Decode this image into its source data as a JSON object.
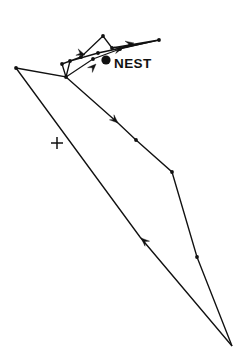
{
  "figure": {
    "background_color": "#ffffff",
    "ink_color": "#111111",
    "width": 242,
    "height": 349
  },
  "labels": {
    "nest_label": "NEST",
    "nest_label_x": 114,
    "nest_label_y": 68,
    "cross_label": "+",
    "cross_x": 57,
    "cross_y": 143
  },
  "chart_data": {
    "type": "line",
    "xlabel": "",
    "ylabel": "",
    "xlim": [
      0,
      242
    ],
    "ylim": [
      0,
      349
    ],
    "grid": false,
    "legend": "none",
    "annotations": [
      {
        "text": "NEST",
        "x": 114,
        "y": 68,
        "kind": "text-label"
      },
      {
        "text": "+",
        "x": 57,
        "y": 143,
        "kind": "reference-cross"
      }
    ],
    "series": [
      {
        "name": "outbound-excursion-loop",
        "points": [
          [
            16,
            68
          ],
          [
            66,
            77
          ],
          [
            62,
            64
          ],
          [
            81,
            57
          ],
          [
            103,
            36
          ],
          [
            112,
            48
          ],
          [
            159,
            40
          ],
          [
            98,
            53
          ],
          [
            70,
            61
          ],
          [
            66,
            77
          ]
        ]
      },
      {
        "name": "nest-vicinity-return",
        "points": [
          [
            66,
            77
          ],
          [
            93,
            59
          ],
          [
            120,
            49
          ],
          [
            159,
            40
          ]
        ]
      },
      {
        "name": "long-outbound-leg",
        "points": [
          [
            66,
            77
          ],
          [
            118,
            123
          ],
          [
            136,
            140
          ],
          [
            172,
            172
          ],
          [
            197,
            257
          ],
          [
            232,
            346
          ]
        ]
      },
      {
        "name": "long-return-leg",
        "points": [
          [
            232,
            346
          ],
          [
            140,
            237
          ],
          [
            16,
            68
          ]
        ]
      }
    ],
    "node_markers": [
      [
        16,
        68
      ],
      [
        66,
        77
      ],
      [
        62,
        64
      ],
      [
        81,
        57
      ],
      [
        103,
        36
      ],
      [
        112,
        48
      ],
      [
        159,
        40
      ],
      [
        98,
        53
      ],
      [
        70,
        61
      ],
      [
        93,
        59
      ],
      [
        120,
        49
      ],
      [
        136,
        140
      ],
      [
        172,
        172
      ],
      [
        197,
        257
      ]
    ],
    "nest_marker": {
      "x": 106,
      "y": 60,
      "radius": 4.6
    },
    "direction_arrows": [
      {
        "x": 118,
        "y": 123,
        "angle_deg": 42,
        "label": "outbound"
      },
      {
        "x": 141,
        "y": 238,
        "angle_deg": 222,
        "label": "inbound"
      },
      {
        "x": 96,
        "y": 64,
        "angle_deg": 315,
        "label": "nest-approach"
      },
      {
        "x": 123,
        "y": 48,
        "angle_deg": 345,
        "label": "loop-east"
      },
      {
        "x": 134,
        "y": 43,
        "angle_deg": 350,
        "label": "loop-east-2"
      },
      {
        "x": 85,
        "y": 55,
        "angle_deg": 20,
        "label": "loop-west"
      }
    ]
  }
}
